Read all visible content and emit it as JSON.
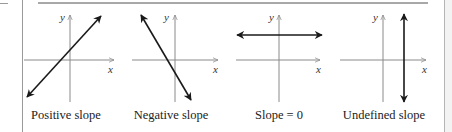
{
  "panels": [
    {
      "label": "Positive slope",
      "axis_x": "x",
      "axis_y": "y",
      "line": "positive"
    },
    {
      "label": "Negative slope",
      "axis_x": "x",
      "axis_y": "y",
      "line": "negative"
    },
    {
      "label": "Slope = 0",
      "axis_x": "x",
      "axis_y": "y",
      "line": "horizontal"
    },
    {
      "label": "Undefined slope",
      "axis_x": "x",
      "axis_y": "y",
      "line": "vertical"
    }
  ],
  "colors": {
    "axis": "#8a8a8a",
    "line": "#1a1a1a",
    "text": "#222222"
  }
}
